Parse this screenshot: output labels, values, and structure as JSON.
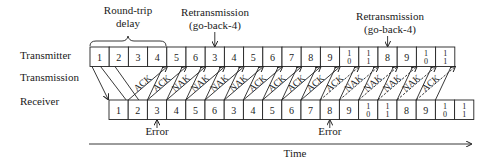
{
  "row_labels": {
    "transmitter": "Transmitter",
    "transmission": "Transmission",
    "receiver": "Receiver"
  },
  "annotations": {
    "round_trip": [
      "Round-trip",
      "delay"
    ],
    "retransmission_1": [
      "Retransmission",
      "(go-back-4)"
    ],
    "retransmission_2": [
      "Retransmission",
      "(go-back-4)"
    ],
    "error_1": "Error",
    "error_2": "Error",
    "time_axis": "Time"
  },
  "transmitter_frames": [
    "1",
    "2",
    "3",
    "4",
    "5",
    "6",
    "3",
    "4",
    "5",
    "6",
    "7",
    "8",
    "9",
    "10",
    "11",
    "8",
    "9",
    "10",
    "11"
  ],
  "receiver_frames": [
    "1",
    "2",
    "3",
    "4",
    "5",
    "6",
    "3",
    "4",
    "5",
    "6",
    "7",
    "8",
    "9",
    "10",
    "11",
    "8",
    "9",
    "10",
    "11"
  ],
  "responses": [
    "ACK",
    "ACK",
    "NAK",
    "NAK",
    "NAK",
    "NAK",
    "ACK",
    "ACK",
    "ACK",
    "ACK",
    "ACK",
    "NAK",
    "NAK",
    "NAK",
    "NAK",
    "ACK"
  ],
  "retransmission_points": [
    7,
    16
  ],
  "error_points": [
    3,
    12
  ],
  "colors": {
    "line": "#222222",
    "text": "#1a1a1a",
    "background": "#ffffff"
  }
}
